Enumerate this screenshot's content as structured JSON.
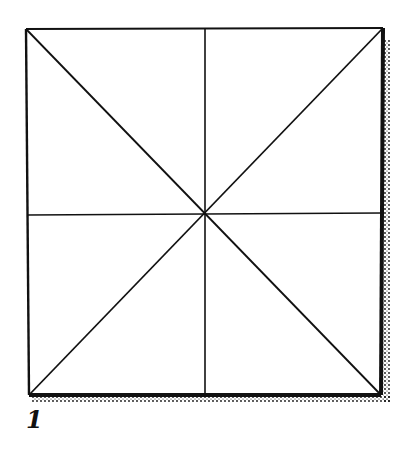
{
  "figure": {
    "label": "1",
    "colors": {
      "stroke": "#111111",
      "background": "#ffffff"
    }
  }
}
